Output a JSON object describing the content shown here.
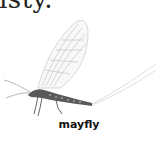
{
  "top_text": "isty.",
  "figure": {
    "caption": "mayfly"
  },
  "colors": {
    "text": "#111111",
    "body": "#555555",
    "wing": "#bbbbbb"
  }
}
